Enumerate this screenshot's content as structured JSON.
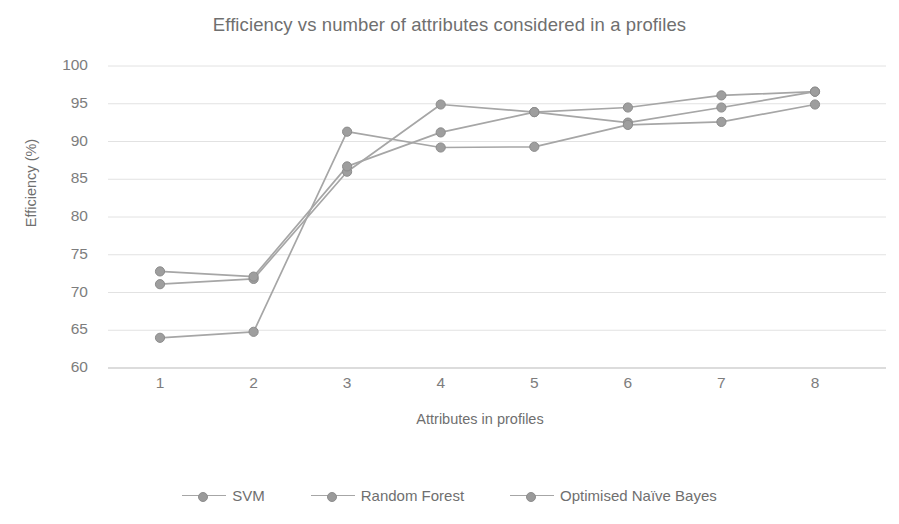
{
  "chart_data": {
    "type": "line",
    "title": "Efficiency vs number of attributes considered in a profiles",
    "xlabel": "Attributes in profiles",
    "ylabel": "Efficiency (%)",
    "x": [
      1,
      2,
      3,
      4,
      5,
      6,
      7,
      8
    ],
    "categories": [
      "1",
      "2",
      "3",
      "4",
      "5",
      "6",
      "7",
      "8"
    ],
    "xlim": [
      1,
      8
    ],
    "ylim": [
      60,
      100
    ],
    "yticks": [
      60,
      65,
      70,
      75,
      80,
      85,
      90,
      95,
      100
    ],
    "ytick_labels": [
      "60",
      "65",
      "70",
      "75",
      "80",
      "85",
      "90",
      "95",
      "100"
    ],
    "xtick_labels": [
      "1",
      "2",
      "3",
      "4",
      "5",
      "6",
      "7",
      "8"
    ],
    "grid": "horizontal",
    "legend_position": "bottom",
    "series": [
      {
        "name": "SVM",
        "color": "#a6a6a6",
        "values": [
          71.1,
          71.8,
          86.0,
          94.9,
          93.9,
          94.5,
          96.1,
          96.6
        ]
      },
      {
        "name": "Random Forest",
        "color": "#a6a6a6",
        "values": [
          72.8,
          72.1,
          86.7,
          91.2,
          93.9,
          92.5,
          94.5,
          96.6
        ]
      },
      {
        "name": "Optimised Naïve Bayes",
        "color": "#a6a6a6",
        "values": [
          64.0,
          64.8,
          91.3,
          89.2,
          89.3,
          92.2,
          92.6,
          94.9
        ]
      }
    ]
  },
  "legend": {
    "entries": [
      "SVM",
      "Random Forest",
      "Optimised Naïve Bayes"
    ]
  }
}
